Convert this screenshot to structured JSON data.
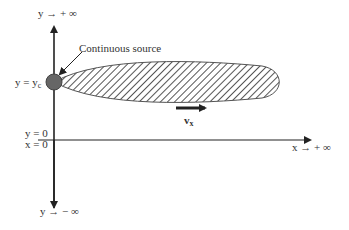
{
  "diagram": {
    "type": "plume-schematic",
    "labels": {
      "y_pos_inf": "y →  + ∞",
      "y_neg_inf": "y →  − ∞",
      "x_pos_inf": "x →  + ∞",
      "y_source": "y = y",
      "y_source_sub": "c",
      "y_zero": "y = 0",
      "x_zero": "x = 0",
      "source_callout": "Continuous source",
      "velocity": "v",
      "velocity_sub": "x"
    },
    "colors": {
      "axis": "#222222",
      "source_fill": "#666666",
      "hatch": "#555555",
      "outline": "#555555"
    }
  }
}
